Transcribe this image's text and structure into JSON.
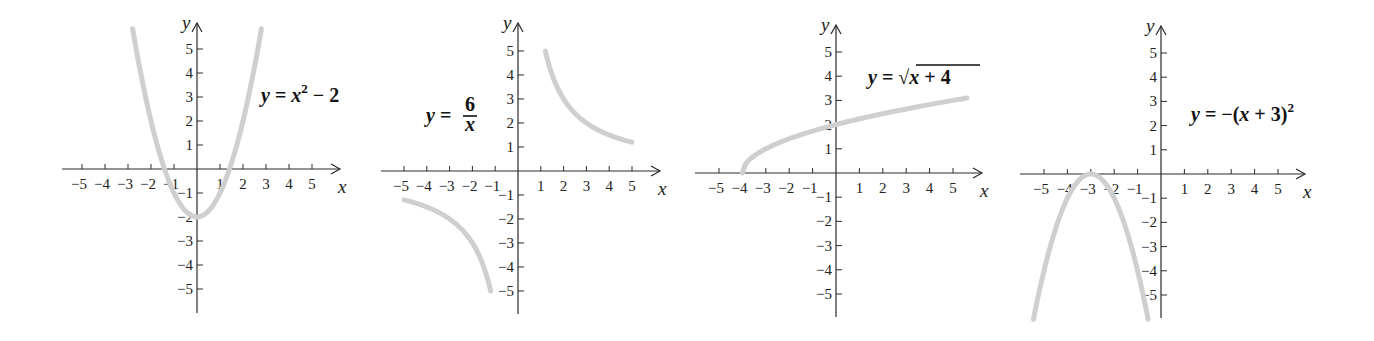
{
  "chart_data": [
    {
      "type": "line",
      "title": "y = x^2 - 2",
      "label_parts": {
        "lhs": "y",
        "eq": "=",
        "rhs_var": "x",
        "sup": "2",
        "rest": "− 2"
      },
      "xlabel": "x",
      "ylabel": "y",
      "xlim": [
        -5,
        5
      ],
      "ylim": [
        -5,
        5
      ],
      "x_ticks": [
        -5,
        -4,
        -3,
        -2,
        -1,
        1,
        2,
        3,
        4,
        5
      ],
      "y_ticks": [
        -5,
        -4,
        -3,
        -2,
        -1,
        1,
        2,
        3,
        4,
        5
      ],
      "function": "x^2-2",
      "domain": [
        -2.8,
        2.8
      ],
      "series": [
        {
          "name": "y = x^2 - 2",
          "x": [
            -2.8,
            -2,
            -1,
            0,
            1,
            2,
            2.8
          ],
          "y": [
            5.84,
            2,
            -1,
            -2,
            -1,
            2,
            5.84
          ]
        }
      ],
      "layout": {
        "ox": 197,
        "oy": 169,
        "ux": 23,
        "uy": 24,
        "x_left": 62,
        "x_right": 340,
        "y_top": 23,
        "y_bottom": 313,
        "label_x": 261,
        "label_y": 102
      }
    },
    {
      "type": "line",
      "title": "y = 6/x",
      "label_parts": {
        "lhs": "y",
        "eq": "=",
        "num": "6",
        "den": "x"
      },
      "xlabel": "x",
      "ylabel": "y",
      "xlim": [
        -5,
        5
      ],
      "ylim": [
        -5,
        5
      ],
      "x_ticks": [
        -5,
        -4,
        -3,
        -2,
        -1,
        1,
        2,
        3,
        4,
        5
      ],
      "y_ticks": [
        -5,
        -4,
        -3,
        -2,
        -1,
        1,
        2,
        3,
        4,
        5
      ],
      "function": "6/x",
      "branches": [
        [
          -5,
          -1.2
        ],
        [
          1.2,
          5
        ]
      ],
      "series": [
        {
          "name": "branch-negative",
          "x": [
            -5,
            -4,
            -3,
            -2,
            -1.2
          ],
          "y": [
            -1.2,
            -1.5,
            -2,
            -3,
            -5
          ]
        },
        {
          "name": "branch-positive",
          "x": [
            1.2,
            2,
            3,
            4,
            5
          ],
          "y": [
            5,
            3,
            2,
            1.5,
            1.2
          ]
        }
      ],
      "layout": {
        "ox": 518,
        "oy": 171,
        "ux": 22.8,
        "uy": 24,
        "x_left": 381,
        "x_right": 660,
        "y_top": 23,
        "y_bottom": 314,
        "label_x": 426,
        "label_y": 122
      }
    },
    {
      "type": "line",
      "title": "y = √(x + 4)",
      "label_parts": {
        "lhs": "y",
        "eq": "=",
        "radical": "√",
        "radicand": "x + 4"
      },
      "xlabel": "x",
      "ylabel": "y",
      "xlim": [
        -5,
        5
      ],
      "ylim": [
        -5,
        5
      ],
      "x_ticks": [
        -5,
        -4,
        -3,
        -2,
        -1,
        1,
        2,
        3,
        4,
        5
      ],
      "y_ticks": [
        -5,
        -4,
        -3,
        -2,
        -1,
        1,
        2,
        3,
        4,
        5
      ],
      "function": "sqrt(x+4)",
      "domain": [
        -4,
        5.6
      ],
      "series": [
        {
          "name": "y = sqrt(x+4)",
          "x": [
            -4,
            -3,
            0,
            5,
            5.6
          ],
          "y": [
            0,
            1,
            2,
            3,
            3.1
          ]
        }
      ],
      "layout": {
        "ox": 836,
        "oy": 173,
        "ux": 23.4,
        "uy": 24.2,
        "x_left": 695,
        "x_right": 982,
        "y_top": 25,
        "y_bottom": 317,
        "label_x": 868,
        "label_y": 84
      }
    },
    {
      "type": "line",
      "title": "y = −(x + 3)^2",
      "label_parts": {
        "lhs": "y",
        "eq": "=",
        "rhs": "−(x + 3)",
        "sup": "2"
      },
      "xlabel": "x",
      "ylabel": "y",
      "xlim": [
        -5,
        5
      ],
      "ylim": [
        -5,
        5
      ],
      "x_ticks": [
        -5,
        -4,
        -3,
        -2,
        -1,
        1,
        2,
        3,
        4,
        5
      ],
      "y_ticks": [
        -5,
        -4,
        -3,
        -2,
        -1,
        1,
        2,
        3,
        4,
        5
      ],
      "function": "-(x+3)^2",
      "domain": [
        -5.45,
        -0.55
      ],
      "series": [
        {
          "name": "y = -(x+3)^2",
          "x": [
            -5.45,
            -5,
            -4,
            -3,
            -2,
            -1,
            -0.55
          ],
          "y": [
            -6,
            -4,
            -1,
            0,
            -1,
            -4,
            -6
          ]
        }
      ],
      "layout": {
        "ox": 1161,
        "oy": 174,
        "ux": 23.4,
        "uy": 24.2,
        "x_left": 1020,
        "x_right": 1305,
        "y_top": 26,
        "y_bottom": 318,
        "label_x": 1191,
        "label_y": 121
      }
    }
  ],
  "axis_labels": {
    "x": "x",
    "y": "y"
  },
  "colors": {
    "axis": "#2a2a2a",
    "curve": "#cfcfcf",
    "text": "#111111",
    "background": "#ffffff"
  }
}
